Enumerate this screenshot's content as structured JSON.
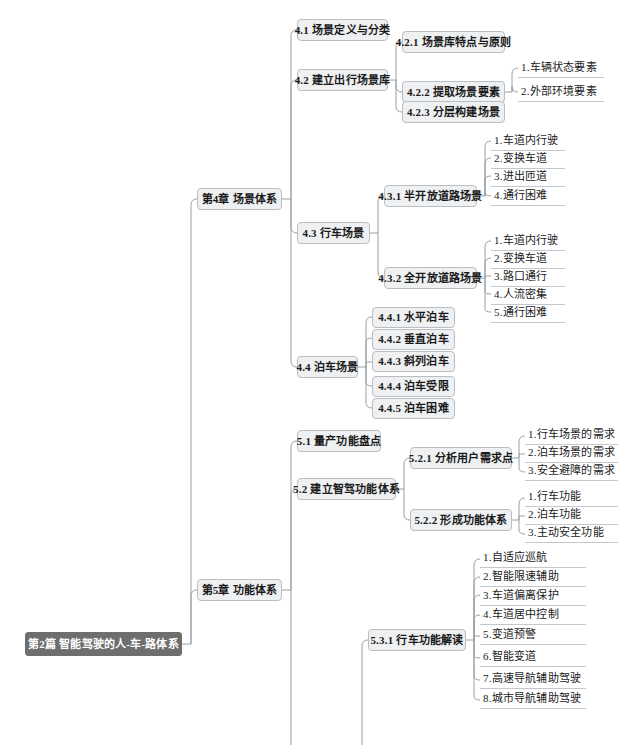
{
  "diagram": {
    "type": "mindmap",
    "title": "第2篇 智能驾驶的人-车-路体系",
    "orientation": "left-to-right",
    "colors": {
      "root_fill": "#6e6e6e",
      "root_text": "#ffffff",
      "node_fill": "#eef0f2",
      "node_border": "#b9bec4",
      "link_stroke": "#9aa0a6",
      "text": "#1a1a1a"
    }
  },
  "root": {
    "label": "第2篇 智能驾驶的人-车-路体系"
  },
  "chapters": [
    {
      "id": "ch4",
      "label": "第4章 场景体系"
    },
    {
      "id": "ch5",
      "label": "第5章 功能体系"
    }
  ],
  "sections": [
    {
      "id": "s41",
      "label": "4.1 场景定义与分类"
    },
    {
      "id": "s42",
      "label": "4.2 建立出行场景库"
    },
    {
      "id": "s421",
      "label": "4.2.1 场景库特点与原则"
    },
    {
      "id": "s422",
      "label": "4.2.2 提取场景要素"
    },
    {
      "id": "s423",
      "label": "4.2.3 分层构建场景"
    },
    {
      "id": "s43",
      "label": "4.3 行车场景"
    },
    {
      "id": "s431",
      "label": "4.3.1 半开放道路场景"
    },
    {
      "id": "s432",
      "label": "4.3.2 全开放道路场景"
    },
    {
      "id": "s44",
      "label": "4.4 泊车场景"
    },
    {
      "id": "s441",
      "label": "4.4.1 水平泊车"
    },
    {
      "id": "s442",
      "label": "4.4.2 垂直泊车"
    },
    {
      "id": "s443",
      "label": "4.4.3 斜列泊车"
    },
    {
      "id": "s444",
      "label": "4.4.4 泊车受限"
    },
    {
      "id": "s445",
      "label": "4.4.5 泊车困难"
    },
    {
      "id": "s51",
      "label": "5.1 量产功能盘点"
    },
    {
      "id": "s52",
      "label": "5.2 建立智驾功能体系"
    },
    {
      "id": "s521",
      "label": "5.2.1 分析用户需求点"
    },
    {
      "id": "s522",
      "label": "5.2.2 形成功能体系"
    },
    {
      "id": "s531",
      "label": "5.3.1 行车功能解读"
    }
  ],
  "leaves": {
    "s422": [
      "1.车辆状态要素",
      "2.外部环境要素"
    ],
    "s431": [
      "1.车道内行驶",
      "2.变换车道",
      "3.进出匝道",
      "4.通行困难"
    ],
    "s432": [
      "1.车道内行驶",
      "2.变换车道",
      "3.路口通行",
      "4.人流密集",
      "5.通行困难"
    ],
    "s521": [
      "1.行车场景的需求",
      "2.泊车场景的需求",
      "3.安全避障的需求"
    ],
    "s522": [
      "1.行车功能",
      "2.泊车功能",
      "3.主动安全功能"
    ],
    "s531": [
      "1.自适应巡航",
      "2.智能限速辅助",
      "3.车道偏离保护",
      "4.车道居中控制",
      "5.变道预警",
      "6.智能变道",
      "7.高速导航辅助驾驶",
      "8.城市导航辅助驾驶"
    ]
  }
}
